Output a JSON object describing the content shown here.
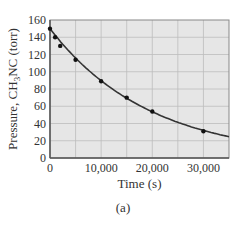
{
  "chart_data": {
    "type": "scatter",
    "title": "",
    "xlabel": "Time (s)",
    "ylabel": "Pressure, CH3NC (torr)",
    "ylabel_parts": {
      "pre": "Pressure, CH",
      "sub": "3",
      "post": "NC (torr)"
    },
    "xlim": [
      0,
      35000
    ],
    "ylim": [
      0,
      160
    ],
    "x_ticks": [
      0,
      10000,
      20000,
      30000
    ],
    "x_tick_labels": [
      "0",
      "10,000",
      "20,000",
      "30,000"
    ],
    "y_ticks": [
      0,
      20,
      40,
      60,
      80,
      100,
      120,
      140,
      160
    ],
    "y_tick_labels": [
      "0",
      "20",
      "40",
      "60",
      "80",
      "100",
      "120",
      "140",
      "160"
    ],
    "grid": true,
    "grid_x_step": 5000,
    "grid_y_step": 20,
    "series": [
      {
        "name": "CH3NC pressure",
        "x": [
          0,
          1000,
          2000,
          5000,
          10000,
          15000,
          20000,
          30000
        ],
        "values": [
          150,
          140,
          130,
          114,
          89,
          70,
          54,
          31
        ]
      }
    ],
    "curve": {
      "type": "exponential decay fit",
      "p0": 150,
      "k": 5.15e-05
    }
  },
  "caption": "(a)",
  "colors": {
    "plot_bg": "#e6e6e6",
    "grid": "#bdbdbd",
    "axis": "#555555",
    "curve": "#333333",
    "points": "#111111"
  }
}
